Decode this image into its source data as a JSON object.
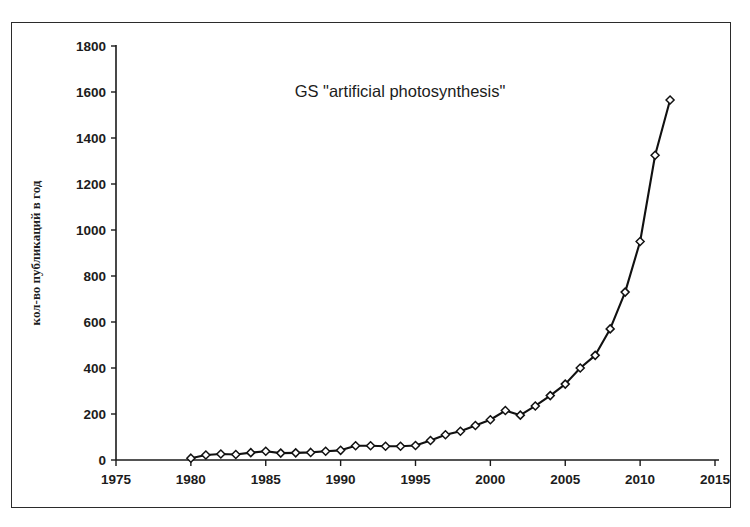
{
  "figure": {
    "name": "publications-per-year-chart",
    "border_color": "#2b2b2b",
    "background": "#ffffff"
  },
  "chart_data": {
    "type": "line",
    "title": "GS \"artificial photosynthesis\"",
    "xlabel": "",
    "ylabel": "кол-во публикаций в год",
    "xlim": [
      1975,
      2015
    ],
    "ylim": [
      0,
      1800
    ],
    "xticks": [
      1975,
      1980,
      1985,
      1990,
      1995,
      2000,
      2005,
      2010,
      2015
    ],
    "yticks": [
      0,
      200,
      400,
      600,
      800,
      1000,
      1200,
      1400,
      1600,
      1800
    ],
    "grid": false,
    "legend": false,
    "marker": "diamond",
    "line_color": "#111111",
    "marker_fill": "#ffffff",
    "x": [
      1980,
      1981,
      1982,
      1983,
      1984,
      1985,
      1986,
      1987,
      1988,
      1989,
      1990,
      1991,
      1992,
      1993,
      1994,
      1995,
      1996,
      1997,
      1998,
      1999,
      2000,
      2001,
      2002,
      2003,
      2004,
      2005,
      2006,
      2007,
      2008,
      2009,
      2010,
      2011,
      2012
    ],
    "values": [
      8,
      22,
      26,
      24,
      32,
      38,
      30,
      31,
      33,
      38,
      42,
      62,
      62,
      60,
      60,
      63,
      85,
      110,
      125,
      150,
      175,
      215,
      195,
      235,
      280,
      330,
      400,
      455,
      570,
      730,
      950,
      1325,
      1565
    ],
    "series": [
      {
        "name": "GS \"artificial photosynthesis\"",
        "values": [
          8,
          22,
          26,
          24,
          32,
          38,
          30,
          31,
          33,
          38,
          42,
          62,
          62,
          60,
          60,
          63,
          85,
          110,
          125,
          150,
          175,
          215,
          195,
          235,
          280,
          330,
          400,
          455,
          570,
          730,
          950,
          1325,
          1565
        ]
      }
    ]
  }
}
